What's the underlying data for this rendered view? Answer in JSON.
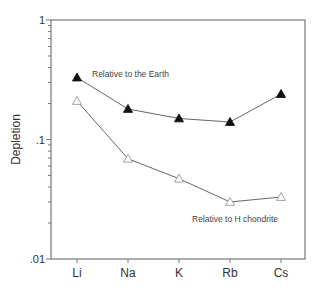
{
  "chart_data": {
    "type": "line",
    "title": "",
    "xlabel": "",
    "ylabel": "Depletion",
    "yscale": "log",
    "ylim": [
      0.01,
      1
    ],
    "yticks": [
      {
        "value": 1,
        "label": "1"
      },
      {
        "value": 0.1,
        "label": ".1"
      },
      {
        "value": 0.01,
        "label": ".01"
      }
    ],
    "categories": [
      "Li",
      "Na",
      "K",
      "Rb",
      "Cs"
    ],
    "grid": false,
    "legend": "none (inline annotations)",
    "series": [
      {
        "name": "Relative to the Earth",
        "marker": "filled-triangle",
        "values": [
          0.33,
          0.18,
          0.15,
          0.14,
          0.24
        ]
      },
      {
        "name": "Relative to H chondrite",
        "marker": "open-triangle",
        "values": [
          0.21,
          0.069,
          0.047,
          0.03,
          0.033
        ]
      }
    ],
    "annotations": [
      {
        "text": "Relative to the Earth",
        "near_series": 0
      },
      {
        "text": "Relative to H chondrite",
        "near_series": 1
      }
    ]
  },
  "layout": {
    "plot_left": 51,
    "plot_right": 305,
    "plot_top": 20,
    "plot_bottom": 259,
    "category_x": [
      77,
      128,
      179,
      230,
      281
    ],
    "annotation_pos": [
      [
        92,
        77
      ],
      [
        192,
        222
      ]
    ],
    "colors": {
      "axis": "#777777",
      "line": "#666666",
      "marker": "#111111",
      "open_marker": "#999999"
    }
  }
}
